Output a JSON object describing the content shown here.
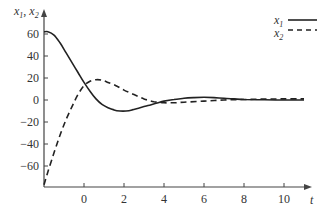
{
  "chart_data": {
    "type": "line",
    "title": "",
    "xlabel": "t",
    "ylabel": "x1, x2",
    "xlim": [
      -2,
      11.3
    ],
    "ylim": [
      -80,
      70
    ],
    "x_ticks": [
      0,
      2,
      4,
      6,
      8,
      10
    ],
    "y_ticks": [
      60,
      40,
      20,
      0,
      -20,
      -40,
      -60
    ],
    "grid": false,
    "legend_position": "top-right",
    "series": [
      {
        "name": "x1",
        "style": "solid",
        "x": [
          -2,
          -1.8,
          -1.5,
          -1.2,
          -0.9,
          -0.6,
          -0.3,
          0,
          0.3,
          0.6,
          0.9,
          1.2,
          1.5,
          1.8,
          2.1,
          2.4,
          2.8,
          3.2,
          3.6,
          4.0,
          4.5,
          5.0,
          5.5,
          6.0,
          6.5,
          7.0,
          7.5,
          8.0,
          9.0,
          10.0,
          11.0
        ],
        "values": [
          62,
          62,
          59,
          52,
          43,
          34,
          25,
          16,
          8,
          1,
          -4,
          -7,
          -9,
          -10,
          -10,
          -9,
          -7,
          -5,
          -3,
          -1,
          0.5,
          1.5,
          2.2,
          2.5,
          2.2,
          1.5,
          1,
          0.5,
          0.2,
          0,
          0
        ]
      },
      {
        "name": "x2",
        "style": "dashed",
        "x": [
          -2,
          -1.8,
          -1.5,
          -1.2,
          -0.9,
          -0.6,
          -0.3,
          0,
          0.3,
          0.6,
          0.9,
          1.2,
          1.6,
          2.0,
          2.5,
          3.0,
          3.5,
          4.0,
          4.5,
          5.0,
          6.0,
          7.0,
          8.0,
          9.0,
          10.0,
          11.0
        ],
        "values": [
          -77,
          -65,
          -48,
          -32,
          -18,
          -6,
          5,
          13,
          17,
          18.5,
          18,
          16,
          13,
          9,
          5,
          1,
          -1.5,
          -2.5,
          -2.5,
          -2,
          -1,
          0,
          0.5,
          0.8,
          1,
          1
        ]
      }
    ]
  },
  "legend": {
    "items": [
      {
        "label": "x",
        "sub": "1",
        "style": "solid"
      },
      {
        "label": "x",
        "sub": "2",
        "style": "dashed"
      }
    ]
  },
  "axes": {
    "y_title_main": "x",
    "y_title_sub1": "1",
    "y_title_sep": ", ",
    "y_title_main2": "x",
    "y_title_sub2": "2",
    "x_title": "t"
  },
  "colors": {
    "line": "#222222",
    "axis": "#444444",
    "text": "#333333"
  }
}
